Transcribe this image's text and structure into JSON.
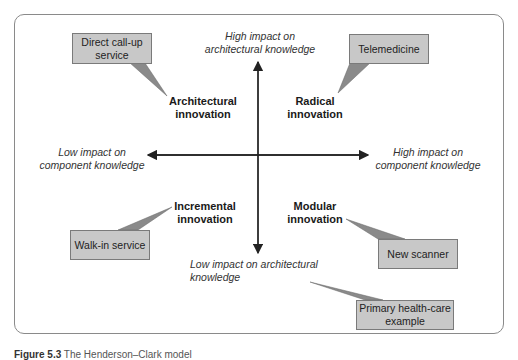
{
  "diagram": {
    "type": "quadrant",
    "axes": {
      "top": [
        "High impact on",
        "architectural knowledge"
      ],
      "bottom": [
        "Low impact on architectural",
        "knowledge"
      ],
      "left": [
        "Low impact on",
        "component knowledge"
      ],
      "right": [
        "High impact on",
        "component knowledge"
      ]
    },
    "quadrants": {
      "top_left": [
        "Architectural",
        "innovation"
      ],
      "top_right": [
        "Radical",
        "innovation"
      ],
      "bottom_left": [
        "Incremental",
        "innovation"
      ],
      "bottom_right": [
        "Modular",
        "innovation"
      ]
    },
    "callouts": {
      "top_left": [
        "Direct call-up",
        "service"
      ],
      "top_right": [
        "Telemedicine"
      ],
      "bottom_left": [
        "Walk-in service"
      ],
      "bottom_right": [
        "New scanner"
      ],
      "legend": [
        "Primary health-care",
        "example"
      ]
    },
    "colors": {
      "callout_fill": "#c8c8c8",
      "callout_border": "#7a7a7a",
      "axis": "#222222",
      "frame": "#8a8a8a"
    }
  },
  "caption": {
    "label": "Figure 5.3",
    "text": "The Henderson–Clark model"
  }
}
